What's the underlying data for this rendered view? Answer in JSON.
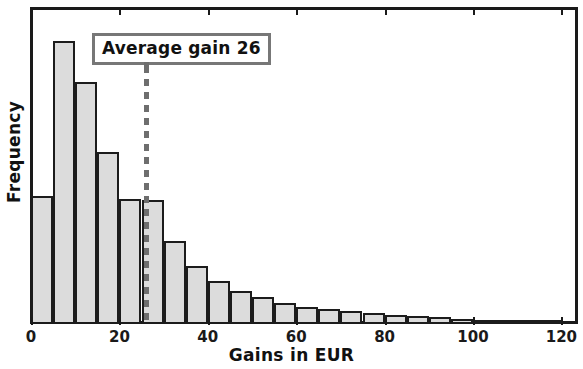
{
  "chart_data": {
    "type": "bar",
    "title": "",
    "subtitle": "",
    "xlabel": "Gains in EUR",
    "ylabel": "Frequency",
    "grid": false,
    "legend": null,
    "xlim": [
      -1,
      124
    ],
    "ylim": [
      0,
      290
    ],
    "xticks": [
      0,
      20,
      40,
      60,
      80,
      100,
      120
    ],
    "xtick_labels": [
      "0",
      "20",
      "40",
      "60",
      "80",
      "100",
      "120"
    ],
    "yticks": [],
    "ytick_labels": [],
    "bin_width": 5,
    "bin_starts": [
      0,
      5,
      10,
      15,
      20,
      25,
      30,
      35,
      40,
      45,
      50,
      55,
      60,
      65,
      70,
      75,
      80,
      85,
      90,
      95,
      100,
      105,
      110,
      115
    ],
    "categories": [
      "0-5",
      "5-10",
      "10-15",
      "15-20",
      "20-25",
      "25-30",
      "30-35",
      "35-40",
      "40-45",
      "45-50",
      "50-55",
      "55-60",
      "60-65",
      "65-70",
      "70-75",
      "75-80",
      "80-85",
      "85-90",
      "90-95",
      "95-100",
      "100-105",
      "105-110",
      "110-115",
      "115-120"
    ],
    "values": [
      117,
      259,
      221,
      157,
      114,
      113,
      76,
      53,
      39,
      30,
      25,
      19,
      16,
      14,
      12,
      10,
      8,
      7,
      6,
      5,
      4,
      4,
      3,
      3
    ],
    "annotations": [
      {
        "name": "average-gain",
        "label": "Average gain 26",
        "x_value": 26,
        "line_style": "dashed",
        "line_color": "#6e6e6e"
      }
    ],
    "colors": {
      "bar_fill": "#dcdcdc",
      "bar_edge": "#1c1c1c",
      "axis": "#1a1a1a",
      "annotation_border": "#777777",
      "annotation_text": "#111111"
    }
  }
}
